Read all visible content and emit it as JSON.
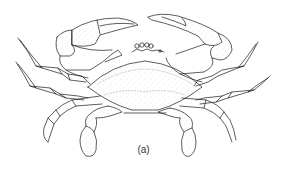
{
  "figure": {
    "caption": "(a)",
    "colors": {
      "background": "#ffffff",
      "line": "#1a1a1a",
      "stipple": "#8a8a8a",
      "caption": "#333333"
    }
  }
}
